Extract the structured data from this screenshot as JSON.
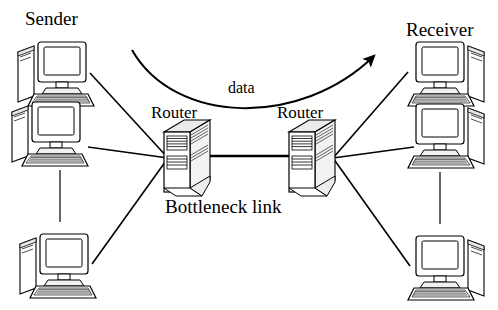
{
  "diagram": {
    "type": "network-topology",
    "canvas": {
      "width": 498,
      "height": 310,
      "background": "#ffffff"
    },
    "colors": {
      "stroke": "#000000",
      "fill_light": "#ffffff",
      "fill_shade": "#d9d9d9",
      "text": "#000000"
    },
    "labels": {
      "sender": "Sender",
      "receiver": "Receiver",
      "router_left": "Router",
      "router_right": "Router",
      "data": "data",
      "bottleneck": "Bottleneck link"
    },
    "nodes": [
      {
        "id": "sender-host-1",
        "kind": "computer",
        "side": "left",
        "x": 14,
        "y": 40,
        "mirrored": false
      },
      {
        "id": "sender-host-2",
        "kind": "computer",
        "side": "left",
        "x": 8,
        "y": 100,
        "mirrored": false
      },
      {
        "id": "sender-host-3",
        "kind": "computer",
        "side": "left",
        "x": 16,
        "y": 232,
        "mirrored": false
      },
      {
        "id": "receiver-host-1",
        "kind": "computer",
        "side": "right",
        "x": 404,
        "y": 40,
        "mirrored": true
      },
      {
        "id": "receiver-host-2",
        "kind": "computer",
        "side": "right",
        "x": 404,
        "y": 102,
        "mirrored": true
      },
      {
        "id": "receiver-host-3",
        "kind": "computer",
        "side": "right",
        "x": 404,
        "y": 234,
        "mirrored": true
      },
      {
        "id": "router-left",
        "kind": "router",
        "x": 158,
        "y": 118
      },
      {
        "id": "router-right",
        "kind": "router",
        "x": 283,
        "y": 118
      }
    ],
    "links": [
      {
        "id": "link-sender1-routerL",
        "from": "sender-host-1",
        "to": "router-left"
      },
      {
        "id": "link-sender2-routerL",
        "from": "sender-host-2",
        "to": "router-left"
      },
      {
        "id": "link-sender3-routerL",
        "from": "sender-host-3",
        "to": "router-left"
      },
      {
        "id": "link-bottleneck",
        "from": "router-left",
        "to": "router-right",
        "emphasis": "thick"
      },
      {
        "id": "link-routerR-receiver1",
        "from": "router-right",
        "to": "receiver-host-1"
      },
      {
        "id": "link-routerR-receiver2",
        "from": "router-right",
        "to": "receiver-host-2"
      },
      {
        "id": "link-routerR-receiver3",
        "from": "router-right",
        "to": "receiver-host-3"
      }
    ],
    "ellipsis_markers": [
      {
        "id": "sender-ellipsis",
        "orientation": "vertical",
        "x": 60,
        "y1": 170,
        "y2": 222
      },
      {
        "id": "receiver-ellipsis",
        "orientation": "vertical",
        "x": 440,
        "y1": 172,
        "y2": 224
      }
    ],
    "flow_arrow": {
      "id": "data-flow-arrow",
      "label": "data",
      "direction": "left-to-right",
      "start": [
        132,
        50
      ],
      "end": [
        378,
        52
      ],
      "shape": "curved-downward-sag"
    }
  }
}
